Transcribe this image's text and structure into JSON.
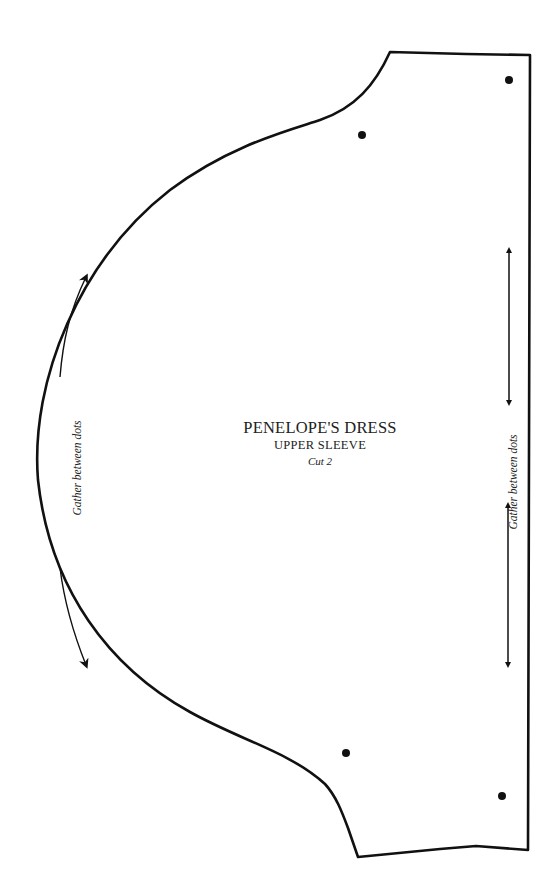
{
  "pattern": {
    "title": "PENELOPE'S DRESS",
    "piece": "UPPER SLEEVE",
    "instruction": "Cut 2"
  },
  "annotations": {
    "left_gather": "Gather between dots",
    "right_gather": "Gather between dots"
  },
  "markers": {
    "dots": [
      {
        "x": 362,
        "y": 135
      },
      {
        "x": 509,
        "y": 80
      },
      {
        "x": 346,
        "y": 753
      },
      {
        "x": 502,
        "y": 796
      }
    ]
  },
  "colors": {
    "line": "#111111",
    "background": "#ffffff"
  }
}
